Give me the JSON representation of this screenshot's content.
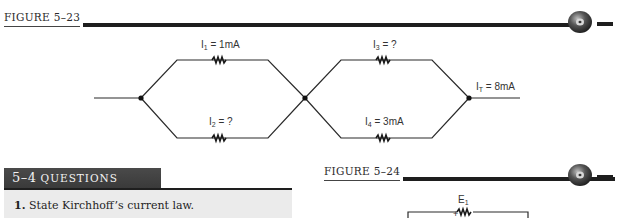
{
  "figure_5_23": {
    "title": "FIGURE 5–23",
    "labels": {
      "i1": {
        "name": "I",
        "sub": "1",
        "value": " = 1mA"
      },
      "i2": {
        "name": "I",
        "sub": "2",
        "value": " = ?"
      },
      "i3": {
        "name": "I",
        "sub": "3",
        "value": " = ?"
      },
      "i4": {
        "name": "I",
        "sub": "4",
        "value": " = 3mA"
      },
      "it": {
        "name": "I",
        "sub": "T",
        "value": " = 8mA"
      }
    },
    "icon": "cd-rom-icon"
  },
  "questions": {
    "section_number": "5–4",
    "section_title": "QUESTIONS",
    "items": [
      {
        "number": "1.",
        "text": "State Kirchhoff’s current law."
      }
    ]
  },
  "figure_5_24": {
    "title": "FIGURE 5–24",
    "labels": {
      "e1": {
        "name": "E",
        "sub": "1"
      },
      "polarity": "+"
    },
    "icon": "cd-rom-icon"
  }
}
